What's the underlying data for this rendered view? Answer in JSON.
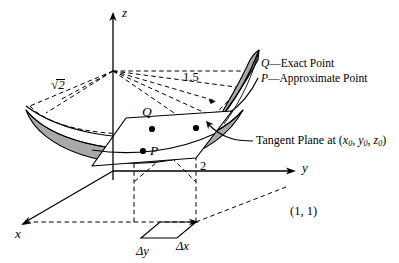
{
  "figure": {
    "axes": {
      "x": "x",
      "y": "y",
      "z": "z"
    },
    "labels": {
      "sqrt2": "2",
      "sqrt_symbol": "√",
      "one_point_five": "1.5",
      "two": "2",
      "point_Q": "Q",
      "point_P": "P",
      "delta_x": "Δx",
      "delta_y": "Δy",
      "base_point": "(1, 1)"
    },
    "callout": {
      "text_before": "Tangent Plane at (",
      "x0_base": "x",
      "x0_sub": "0",
      "sep1": ", ",
      "y0_base": "y",
      "y0_sub": "0",
      "sep2": ", ",
      "z0_base": "z",
      "z0_sub": "0",
      "text_after": ")"
    },
    "legend": [
      {
        "symbol": "Q",
        "dash": "—",
        "text": "Exact Point"
      },
      {
        "symbol": "P",
        "dash": "—",
        "text": "Approximate Point"
      }
    ],
    "colors": {
      "stroke": "#000000",
      "surface_fill": "#a9a9a9",
      "plane_fill": "#ffffff",
      "background": "#ffffff"
    }
  }
}
